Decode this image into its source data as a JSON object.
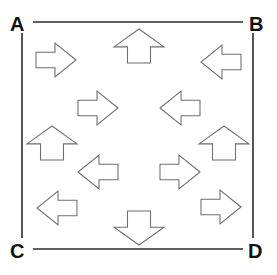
{
  "figure": {
    "background_color": "#ffffff",
    "width": 277,
    "height": 275,
    "frame": {
      "line_color": "#2b2b2b",
      "line_width": 1.6,
      "segments": [
        {
          "name": "top-edge",
          "x1": 33,
          "y1": 22,
          "x2": 243,
          "y2": 22
        },
        {
          "name": "bottom-edge",
          "x1": 33,
          "y1": 249,
          "x2": 243,
          "y2": 249
        },
        {
          "name": "left-edge",
          "x1": 22,
          "y1": 33,
          "x2": 22,
          "y2": 238
        },
        {
          "name": "right-edge",
          "x1": 253,
          "y1": 33,
          "x2": 253,
          "y2": 238
        }
      ]
    },
    "corner_labels": [
      {
        "name": "corner-label-a",
        "text": "A",
        "position": "top-left"
      },
      {
        "name": "corner-label-b",
        "text": "B",
        "position": "top-right"
      },
      {
        "name": "corner-label-c",
        "text": "C",
        "position": "bottom-left"
      },
      {
        "name": "corner-label-d",
        "text": "D",
        "position": "bottom-right"
      }
    ],
    "arrow_style": {
      "fill_color": "#ffffff",
      "stroke_color": "#6d6d6d",
      "stroke_width": 1.05,
      "shape": "block-arrow-pentagon-with-notch"
    },
    "arrows": [
      {
        "id": "arrow-top-left",
        "direction": "right",
        "cx": 56,
        "cy": 60,
        "len": 40,
        "w": 34,
        "rot": 0
      },
      {
        "id": "arrow-top-center",
        "direction": "up",
        "cx": 139,
        "cy": 46,
        "len": 34,
        "w": 50,
        "rot": -90
      },
      {
        "id": "arrow-top-right",
        "direction": "left",
        "cx": 221,
        "cy": 62,
        "len": 40,
        "w": 34,
        "rot": 180
      },
      {
        "id": "arrow-inner-upper-left",
        "direction": "right",
        "cx": 98,
        "cy": 108,
        "len": 40,
        "w": 34,
        "rot": 0
      },
      {
        "id": "arrow-inner-upper-right",
        "direction": "left",
        "cx": 180,
        "cy": 108,
        "len": 40,
        "w": 34,
        "rot": 180
      },
      {
        "id": "arrow-left-middle",
        "direction": "up",
        "cx": 52,
        "cy": 143,
        "len": 34,
        "w": 50,
        "rot": -90
      },
      {
        "id": "arrow-right-middle",
        "direction": "up",
        "cx": 224,
        "cy": 143,
        "len": 34,
        "w": 50,
        "rot": -90
      },
      {
        "id": "arrow-inner-lower-left",
        "direction": "left",
        "cx": 98,
        "cy": 172,
        "len": 40,
        "w": 34,
        "rot": 180
      },
      {
        "id": "arrow-inner-lower-right",
        "direction": "right",
        "cx": 180,
        "cy": 172,
        "len": 40,
        "w": 34,
        "rot": 0
      },
      {
        "id": "arrow-bottom-left",
        "direction": "left",
        "cx": 57,
        "cy": 208,
        "len": 40,
        "w": 34,
        "rot": 180
      },
      {
        "id": "arrow-bottom-center",
        "direction": "down",
        "cx": 139,
        "cy": 228,
        "len": 34,
        "w": 50,
        "rot": 90
      },
      {
        "id": "arrow-bottom-right",
        "direction": "right",
        "cx": 221,
        "cy": 207,
        "len": 40,
        "w": 34,
        "rot": 0
      }
    ],
    "arrow_direction_counts": {
      "right": 4,
      "left": 4,
      "up": 3,
      "down": 1
    }
  }
}
